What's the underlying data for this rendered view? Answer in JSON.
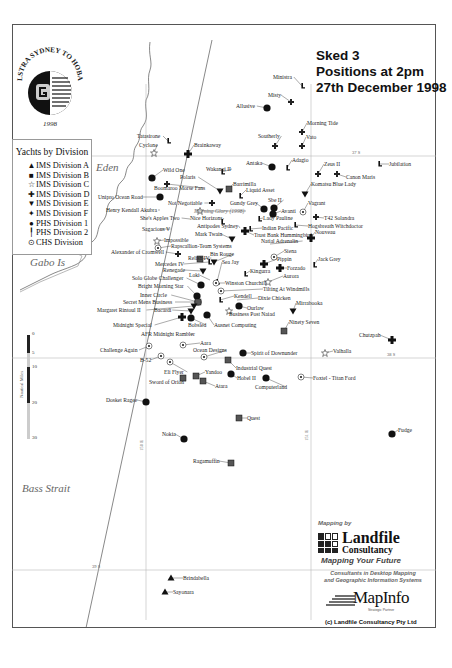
{
  "map_title": {
    "line1": "Sked 3",
    "line2": "Positions at 2pm",
    "line3": "27th December 1998"
  },
  "logo": {
    "ring_text": "TELSTRA SYDNEY TO HOBART",
    "year": "1998"
  },
  "legend": {
    "title": "Yachts by Division",
    "items": [
      {
        "symbol": "triangle",
        "glyph": "▲",
        "label": "IMS Division A"
      },
      {
        "symbol": "square",
        "glyph": "■",
        "label": "IMS Division B"
      },
      {
        "symbol": "star-outline",
        "glyph": "☆",
        "label": "IMS Division C"
      },
      {
        "symbol": "cross",
        "glyph": "✚",
        "label": "IMS Division D"
      },
      {
        "symbol": "down-triangle",
        "glyph": "▼",
        "label": "IMS Division E"
      },
      {
        "symbol": "small-cross",
        "glyph": "✦",
        "label": "IMS Division F"
      },
      {
        "symbol": "circle",
        "glyph": "●",
        "label": "PHS Division 1"
      },
      {
        "symbol": "flag",
        "glyph": "╿",
        "label": "PHS Division 2"
      },
      {
        "symbol": "circled-dot",
        "glyph": "⊙",
        "label": "CHS Division"
      }
    ]
  },
  "regions": [
    {
      "name": "Eden",
      "x": 96,
      "y": 168
    },
    {
      "name": "Gabo Is",
      "x": 30,
      "y": 263
    },
    {
      "name": "Bass Strait",
      "x": 22,
      "y": 489
    }
  ],
  "grid": {
    "latitudes": [
      {
        "label": "37 S",
        "y": 156,
        "label_x": 352
      },
      {
        "label": "38 S",
        "y": 358,
        "label_x": 387
      },
      {
        "label": "39 S",
        "y": 570,
        "label_x": 92
      }
    ],
    "longitudes": [
      {
        "label": "150 E",
        "x": 146,
        "label_y": 440
      },
      {
        "label": "151 E",
        "x": 311,
        "label_y": 430
      }
    ]
  },
  "scale": {
    "title": "Nautical Miles",
    "ticks": [
      "0",
      "5",
      "10",
      "20",
      "30"
    ]
  },
  "yachts": [
    {
      "name": "Ministra",
      "div": "flag",
      "x": 302,
      "y": 86,
      "lx": 273,
      "ly": 77
    },
    {
      "name": "Misty",
      "div": "small-cross",
      "x": 291,
      "y": 102,
      "lx": 268,
      "ly": 95
    },
    {
      "name": "Allusive",
      "div": "circle",
      "x": 267,
      "y": 108,
      "lx": 236,
      "ly": 106
    },
    {
      "name": "Morning Tide",
      "div": "small-cross",
      "x": 302,
      "y": 132,
      "lx": 307,
      "ly": 123
    },
    {
      "name": "Southerly",
      "div": "small-cross",
      "x": 275,
      "y": 146,
      "lx": 258,
      "ly": 136
    },
    {
      "name": "Vato",
      "div": "small-cross",
      "x": 302,
      "y": 146,
      "lx": 306,
      "ly": 137
    },
    {
      "name": "Tatasirone",
      "div": "flag",
      "x": 168,
      "y": 141,
      "lx": 137,
      "ly": 136
    },
    {
      "name": "Cyclone",
      "div": "star-outline",
      "x": 154,
      "y": 153,
      "lx": 139,
      "ly": 145
    },
    {
      "name": "Brainkaway",
      "div": "cross",
      "x": 188,
      "y": 154,
      "lx": 194,
      "ly": 145
    },
    {
      "name": "Jubilation",
      "div": "flag",
      "x": 379,
      "y": 164,
      "lx": 389,
      "ly": 164
    },
    {
      "name": "Antaka",
      "div": "circle",
      "x": 272,
      "y": 167,
      "lx": 246,
      "ly": 163
    },
    {
      "name": "Adagio",
      "div": "flag",
      "x": 287,
      "y": 168,
      "lx": 292,
      "ly": 160
    },
    {
      "name": "Zeus II",
      "div": "small-cross",
      "x": 318,
      "y": 174,
      "lx": 324,
      "ly": 164
    },
    {
      "name": "Canon Maris",
      "div": "small-cross",
      "x": 337,
      "y": 174,
      "lx": 346,
      "ly": 177
    },
    {
      "name": "Wild One",
      "div": "circle",
      "x": 152,
      "y": 178,
      "lx": 163,
      "ly": 170
    },
    {
      "name": "Wakanui II",
      "div": "flag",
      "x": 222,
      "y": 172,
      "lx": 206,
      "ly": 169
    },
    {
      "name": "Polaris",
      "div": "down-triangle",
      "x": 220,
      "y": 191,
      "lx": 180,
      "ly": 177
    },
    {
      "name": "Komatsu Blue Lady",
      "div": "down-triangle",
      "x": 305,
      "y": 194,
      "lx": 311,
      "ly": 184
    },
    {
      "name": "Barrimilla",
      "div": "square",
      "x": 229,
      "y": 189,
      "lx": 233,
      "ly": 184
    },
    {
      "name": "Boomaroo Morse Fans",
      "div": "small-cross",
      "x": 167,
      "y": 184,
      "lx": 154,
      "ly": 188
    },
    {
      "name": "Liquid Asset",
      "div": "flag",
      "x": 240,
      "y": 196,
      "lx": 246,
      "ly": 190
    },
    {
      "name": "Unipro Ocean Road",
      "div": "circle",
      "x": 160,
      "y": 197,
      "lx": 98,
      "ly": 197
    },
    {
      "name": "Gundy Grey",
      "div": "circle",
      "x": 264,
      "y": 209,
      "lx": 230,
      "ly": 203
    },
    {
      "name": "Sbe II",
      "div": "circle",
      "x": 274,
      "y": 208,
      "lx": 268,
      "ly": 200
    },
    {
      "name": "Not Negotiable",
      "div": "small-cross",
      "x": 212,
      "y": 203,
      "lx": 168,
      "ly": 203
    },
    {
      "name": "Vagrant",
      "div": "circled-dot",
      "x": 303,
      "y": 212,
      "lx": 308,
      "ly": 203
    },
    {
      "name": "Henry Kendall Akubra",
      "div": "none",
      "x": 160,
      "y": 210,
      "lx": 106,
      "ly": 210
    },
    {
      "name": "Morning Glory (1998)",
      "div": "star-outline",
      "x": 200,
      "y": 211,
      "lx": 194,
      "ly": 211
    },
    {
      "name": "Avanti",
      "div": "circle",
      "x": 273,
      "y": 214,
      "lx": 281,
      "ly": 211
    },
    {
      "name": "Lady Pauline",
      "div": "flag",
      "x": 259,
      "y": 219,
      "lx": 263,
      "ly": 218
    },
    {
      "name": "T42 Solandra",
      "div": "small-cross",
      "x": 316,
      "y": 217,
      "lx": 324,
      "ly": 218
    },
    {
      "name": "She's Apples Two",
      "div": "none",
      "x": 190,
      "y": 219,
      "lx": 140,
      "ly": 218
    },
    {
      "name": "Nice Horizons",
      "div": "flag",
      "x": 222,
      "y": 222,
      "lx": 190,
      "ly": 218
    },
    {
      "name": "Hogsbreath Witchdoctor",
      "div": "flag",
      "x": 295,
      "y": 225,
      "lx": 308,
      "ly": 226
    },
    {
      "name": "Antipodes Sydney",
      "div": "none",
      "x": 240,
      "y": 228,
      "lx": 197,
      "ly": 226
    },
    {
      "name": "Indian Pacific",
      "div": "flag",
      "x": 250,
      "y": 229,
      "lx": 262,
      "ly": 228
    },
    {
      "name": "Sagacious V",
      "div": "none",
      "x": 160,
      "y": 229,
      "lx": 142,
      "ly": 229
    },
    {
      "name": "Mark Twain",
      "div": "down-triangle",
      "x": 232,
      "y": 239,
      "lx": 195,
      "ly": 234
    },
    {
      "name": "Trust Bank Hummingbird",
      "div": "cross",
      "x": 245,
      "y": 231,
      "lx": 254,
      "ly": 235
    },
    {
      "name": "Nouveau",
      "div": "cross",
      "x": 311,
      "y": 238,
      "lx": 315,
      "ly": 232
    },
    {
      "name": "Impossible",
      "div": "star-outline",
      "x": 157,
      "y": 241,
      "lx": 164,
      "ly": 240
    },
    {
      "name": "Natial Adrenalin",
      "div": "none",
      "x": 270,
      "y": 244,
      "lx": 261,
      "ly": 241
    },
    {
      "name": "Rapscallion-Team Systems",
      "div": "circled-dot",
      "x": 158,
      "y": 248,
      "lx": 171,
      "ly": 246
    },
    {
      "name": "Alexander of Cromwell",
      "div": "small-cross",
      "x": 178,
      "y": 254,
      "lx": 111,
      "ly": 252
    },
    {
      "name": "Bin Rouge",
      "div": "down-triangle",
      "x": 214,
      "y": 262,
      "lx": 210,
      "ly": 254
    },
    {
      "name": "Siena",
      "div": "circled-dot",
      "x": 274,
      "y": 257,
      "lx": 284,
      "ly": 251
    },
    {
      "name": "Jack Grey",
      "div": "flag",
      "x": 314,
      "y": 265,
      "lx": 318,
      "ly": 259
    },
    {
      "name": "Relish IV",
      "div": "square",
      "x": 200,
      "y": 259,
      "lx": 188,
      "ly": 258
    },
    {
      "name": "Pippin",
      "div": "cross",
      "x": 264,
      "y": 264,
      "lx": 277,
      "ly": 259
    },
    {
      "name": "Sea Jay",
      "div": "flag",
      "x": 217,
      "y": 282,
      "lx": 222,
      "ly": 262
    },
    {
      "name": "Mercedes IV",
      "div": "flag",
      "x": 209,
      "y": 262,
      "lx": 155,
      "ly": 264
    },
    {
      "name": "Forzado",
      "div": "cross",
      "x": 280,
      "y": 268,
      "lx": 287,
      "ly": 268
    },
    {
      "name": "Renegade",
      "div": "down-triangle",
      "x": 203,
      "y": 271,
      "lx": 163,
      "ly": 270
    },
    {
      "name": "Kingurra",
      "div": "flag",
      "x": 245,
      "y": 274,
      "lx": 250,
      "ly": 271
    },
    {
      "name": "Loki",
      "div": "none",
      "x": 210,
      "y": 280,
      "lx": 189,
      "ly": 275
    },
    {
      "name": "Aurora",
      "div": "star-outline",
      "x": 268,
      "y": 282,
      "lx": 283,
      "ly": 276
    },
    {
      "name": "Solo Globe Challenger",
      "div": "circle",
      "x": 201,
      "y": 285,
      "lx": 132,
      "ly": 278
    },
    {
      "name": "Winston Churchill",
      "div": "circled-dot",
      "x": 216,
      "y": 283,
      "lx": 225,
      "ly": 283
    },
    {
      "name": "Bright Morning Star",
      "div": "circle",
      "x": 197,
      "y": 296,
      "lx": 138,
      "ly": 286
    },
    {
      "name": "Tilting At Windmills",
      "div": "circled-dot",
      "x": 221,
      "y": 291,
      "lx": 263,
      "ly": 289
    },
    {
      "name": "Kendell",
      "div": "flag",
      "x": 220,
      "y": 300,
      "lx": 234,
      "ly": 296
    },
    {
      "name": "Dixie Chicken",
      "div": "none",
      "x": 237,
      "y": 300,
      "lx": 258,
      "ly": 298
    },
    {
      "name": "Inner Circle",
      "div": "circle",
      "x": 198,
      "y": 302,
      "lx": 140,
      "ly": 295
    },
    {
      "name": "Ourlaw",
      "div": "circle",
      "x": 239,
      "y": 306,
      "lx": 247,
      "ly": 308
    },
    {
      "name": "Secret Mens Business",
      "div": "square",
      "x": 198,
      "y": 302,
      "lx": 123,
      "ly": 302
    },
    {
      "name": "Margaret Rintoul II",
      "div": "down-triangle",
      "x": 194,
      "y": 306,
      "lx": 97,
      "ly": 310
    },
    {
      "name": "Mirrabooka",
      "div": "down-triangle",
      "x": 293,
      "y": 311,
      "lx": 296,
      "ly": 303
    },
    {
      "name": "Business Post Naiad",
      "div": "star-outline",
      "x": 229,
      "y": 311,
      "lx": 229,
      "ly": 314
    },
    {
      "name": "Bacardi",
      "div": "down-triangle",
      "x": 191,
      "y": 311,
      "lx": 154,
      "ly": 310
    },
    {
      "name": "Midnight Special",
      "div": "cross",
      "x": 182,
      "y": 317,
      "lx": 113,
      "ly": 325
    },
    {
      "name": "Bobsled",
      "div": "circle",
      "x": 191,
      "y": 318,
      "lx": 188,
      "ly": 325
    },
    {
      "name": "Ausnet Computing",
      "div": "circle",
      "x": 207,
      "y": 315,
      "lx": 214,
      "ly": 325
    },
    {
      "name": "Ninety Seven",
      "div": "square",
      "x": 284,
      "y": 331,
      "lx": 289,
      "ly": 322
    },
    {
      "name": "Chutzpah",
      "div": "cross",
      "x": 392,
      "y": 340,
      "lx": 359,
      "ly": 335
    },
    {
      "name": "AFR Midnight Rambler",
      "div": "none",
      "x": 190,
      "y": 334,
      "lx": 141,
      "ly": 334
    },
    {
      "name": "Aara",
      "div": "circled-dot",
      "x": 183,
      "y": 345,
      "lx": 200,
      "ly": 343
    },
    {
      "name": "Challenge Again",
      "div": "circled-dot",
      "x": 149,
      "y": 346,
      "lx": 100,
      "ly": 350
    },
    {
      "name": "Ocean Designs",
      "div": "circled-dot",
      "x": 204,
      "y": 357,
      "lx": 193,
      "ly": 350
    },
    {
      "name": "Spirit of Downunder",
      "div": "circle",
      "x": 243,
      "y": 353,
      "lx": 251,
      "ly": 353
    },
    {
      "name": "Valhalla",
      "div": "star-outline",
      "x": 325,
      "y": 353,
      "lx": 333,
      "ly": 351
    },
    {
      "name": "B-52",
      "div": "circled-dot",
      "x": 161,
      "y": 356,
      "lx": 140,
      "ly": 360
    },
    {
      "name": "Industrial Quest",
      "div": "square",
      "x": 228,
      "y": 360,
      "lx": 236,
      "ly": 368
    },
    {
      "name": "Eli Flyer",
      "div": "circled-dot",
      "x": 170,
      "y": 362,
      "lx": 164,
      "ly": 372
    },
    {
      "name": "Yandoo",
      "div": "square",
      "x": 196,
      "y": 376,
      "lx": 205,
      "ly": 372
    },
    {
      "name": "Hobel II",
      "div": "circle",
      "x": 231,
      "y": 374,
      "lx": 237,
      "ly": 378
    },
    {
      "name": "Foxtel - Titan Ford",
      "div": "circled-dot",
      "x": 301,
      "y": 377,
      "lx": 313,
      "ly": 378
    },
    {
      "name": "Sword of Orion",
      "div": "square",
      "x": 183,
      "y": 378,
      "lx": 149,
      "ly": 382
    },
    {
      "name": "Atara",
      "div": "square",
      "x": 203,
      "y": 381,
      "lx": 215,
      "ly": 386
    },
    {
      "name": "Computerland",
      "div": "circle",
      "x": 266,
      "y": 378,
      "lx": 255,
      "ly": 387
    },
    {
      "name": "Dosket Ragee",
      "div": "circle",
      "x": 146,
      "y": 402,
      "lx": 106,
      "ly": 400
    },
    {
      "name": "Quest",
      "div": "square",
      "x": 239,
      "y": 418,
      "lx": 247,
      "ly": 418
    },
    {
      "name": "Nokia",
      "div": "circle",
      "x": 184,
      "y": 439,
      "lx": 162,
      "ly": 434
    },
    {
      "name": "Fudge",
      "div": "circle",
      "x": 392,
      "y": 434,
      "lx": 398,
      "ly": 430
    },
    {
      "name": "Ragamuffin",
      "div": "square",
      "x": 231,
      "y": 463,
      "lx": 193,
      "ly": 461
    },
    {
      "name": "Brindabella",
      "div": "triangle",
      "x": 171,
      "y": 578,
      "lx": 183,
      "ly": 578
    },
    {
      "name": "Sayonara",
      "div": "triangle",
      "x": 165,
      "y": 592,
      "lx": 173,
      "ly": 592
    }
  ],
  "credits": {
    "mapping_by": "Mapping by",
    "company_line1": "Landfile",
    "company_line2": "Consultancy",
    "tagline": "Mapping Your Future",
    "description_line1": "Consultants in Desktop Mapping",
    "description_line2": "and Geographic Information Systems",
    "partner_brand": "MapInfo",
    "partner_label": "Strategic Partner",
    "copyright": "(c) Landfile Consultancy Pty Ltd"
  }
}
